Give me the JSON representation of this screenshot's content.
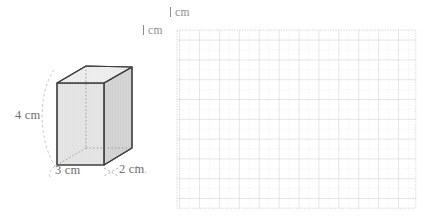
{
  "figure": {
    "prism": {
      "name": "rectangular-prism",
      "labels": {
        "height": "4 cm",
        "width": "3 cm",
        "depth": "2 cm"
      },
      "dimensions": {
        "height_cm": 4,
        "width_cm": 3,
        "depth_cm": 2
      },
      "colors": {
        "front_face": "#e4e4e4",
        "right_face": "#d2d2d2",
        "top_face": "#efefef",
        "edge": "#3f3f3f",
        "hidden_edge": "#9a9a9a",
        "leader": "#b3b3b3"
      }
    },
    "grid": {
      "name": "centimetre-grid",
      "top_label": "1 cm",
      "left_label": "1 cm",
      "unit": "cm",
      "major_cols": 12,
      "major_rows": 9,
      "minor_per_major": 2,
      "colors": {
        "major_line": "#c9cdd6",
        "minor_line": "#dfe2e8",
        "border": "#c9cdd6"
      }
    }
  },
  "label_text": {
    "one": "1",
    "cm": "cm"
  }
}
